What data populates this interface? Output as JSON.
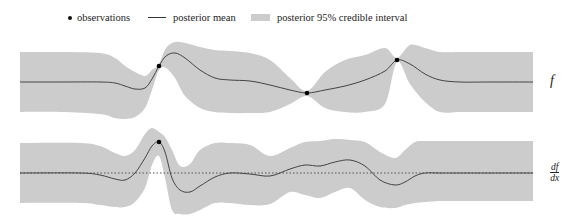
{
  "legend": {
    "observations": "observations",
    "posterior_mean": "posterior mean",
    "credible_interval": "posterior 95% credible interval"
  },
  "labels": {
    "top_panel": "f",
    "bottom_panel_num": "df",
    "bottom_panel_den": "dx"
  },
  "colors": {
    "band": "#cccccc",
    "mean": "#444444",
    "observation": "#000000",
    "zero_line": "#555555"
  },
  "chart_data": [
    {
      "type": "line",
      "title": "f",
      "xlabel": "",
      "ylabel": "f",
      "grid": false,
      "legend_position": "top",
      "pixel_frame": {
        "x0": 20,
        "x1": 533,
        "y_center": 82
      },
      "x": [
        20,
        60,
        100,
        115,
        125,
        135,
        145,
        152,
        159,
        166,
        175,
        185,
        200,
        215,
        230,
        250,
        270,
        290,
        307,
        325,
        345,
        365,
        385,
        397,
        410,
        425,
        440,
        460,
        490,
        533
      ],
      "series": [
        {
          "name": "posterior mean",
          "values": [
            82,
            82,
            82,
            83,
            86,
            89,
            88,
            79,
            66,
            56,
            53,
            58,
            70,
            78,
            80,
            81,
            85,
            90,
            93,
            90,
            86,
            80,
            71,
            60,
            64,
            74,
            80,
            82,
            82,
            82
          ]
        },
        {
          "name": "upper 95%",
          "values": [
            52,
            52,
            53,
            58,
            66,
            72,
            76,
            70,
            64,
            48,
            42,
            43,
            47,
            50,
            51,
            53,
            60,
            78,
            91,
            72,
            60,
            55,
            48,
            58,
            45,
            48,
            52,
            52,
            52,
            52
          ]
        },
        {
          "name": "lower 95%",
          "values": [
            112,
            112,
            114,
            118,
            119,
            117,
            108,
            90,
            70,
            68,
            78,
            96,
            108,
            112,
            113,
            113,
            112,
            104,
            96,
            108,
            112,
            112,
            104,
            62,
            84,
            102,
            112,
            112,
            112,
            112
          ]
        }
      ],
      "observations": [
        {
          "x": 159,
          "y": 66
        },
        {
          "x": 307,
          "y": 93
        },
        {
          "x": 397,
          "y": 60
        }
      ]
    },
    {
      "type": "line",
      "title": "df/dx",
      "xlabel": "",
      "ylabel": "df/dx",
      "grid": false,
      "zero_line": {
        "y": 173,
        "style": "dotted"
      },
      "pixel_frame": {
        "x0": 20,
        "x1": 533,
        "y_center": 173
      },
      "x": [
        20,
        80,
        100,
        115,
        125,
        135,
        145,
        152,
        159,
        165,
        172,
        180,
        190,
        200,
        215,
        230,
        250,
        270,
        290,
        305,
        320,
        335,
        350,
        365,
        380,
        395,
        405,
        415,
        425,
        440,
        460,
        533
      ],
      "series": [
        {
          "name": "posterior mean",
          "values": [
            173,
            173,
            175,
            179,
            180,
            173,
            158,
            146,
            142,
            152,
            178,
            190,
            192,
            186,
            177,
            173,
            174,
            176,
            169,
            165,
            166,
            162,
            160,
            166,
            180,
            185,
            182,
            176,
            173,
            173,
            173,
            173
          ]
        },
        {
          "name": "upper 95%",
          "values": [
            143,
            143,
            146,
            153,
            156,
            150,
            134,
            128,
            132,
            137,
            150,
            166,
            164,
            150,
            143,
            143,
            145,
            156,
            148,
            142,
            141,
            139,
            140,
            142,
            152,
            158,
            150,
            142,
            141,
            141,
            141,
            141
          ]
        },
        {
          "name": "lower 95%",
          "values": [
            203,
            203,
            205,
            207,
            207,
            202,
            188,
            165,
            156,
            178,
            210,
            214,
            214,
            210,
            203,
            203,
            205,
            204,
            192,
            195,
            198,
            192,
            188,
            200,
            207,
            208,
            205,
            203,
            202,
            201,
            201,
            201
          ]
        }
      ],
      "observations": [
        {
          "x": 159,
          "y": 142
        }
      ]
    }
  ]
}
